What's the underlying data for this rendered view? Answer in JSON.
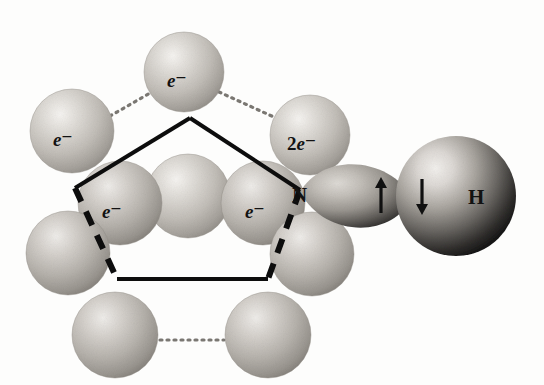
{
  "figure": {
    "background_color": "#fdfdfc",
    "width": 544,
    "height": 385
  },
  "palette": {
    "sphere_light": "#d8d5d0",
    "sphere_mid": "#b4b0aa",
    "sphere_shadow": "#8e8a84",
    "sphere_dark": "#6f6b66",
    "highlight": "#f4f2ef",
    "lobe_light": "#cfcbc5",
    "lobe_dark": "#2b2a28",
    "hydrogen_light": "#e8e5e1",
    "hydrogen_dark": "#141414",
    "outline_black": "#0d0d0d",
    "dotted_gray": "#7a7772"
  },
  "labels": {
    "electron_single": "e",
    "electron_superscript": "−",
    "electron_pair_count": "2",
    "nitrogen": "N",
    "hydrogen": "H",
    "spin_up": "↑",
    "spin_down": "↓"
  },
  "spheres": [
    {
      "id": "sphere-top",
      "name": "surface-atom-top",
      "cx": 184,
      "cy": 72,
      "r": 40,
      "shade": "light",
      "label": "e-",
      "label_dx": -17,
      "label_dy": 7
    },
    {
      "id": "sphere-upper-left",
      "name": "surface-atom-upper-left",
      "cx": 72,
      "cy": 131,
      "r": 42,
      "shade": "light",
      "label": "e-",
      "label_dx": -19,
      "label_dy": 7
    },
    {
      "id": "sphere-upper-right",
      "name": "surface-atom-upper-right",
      "cx": 310,
      "cy": 135,
      "r": 40,
      "shade": "light",
      "label": "2e-",
      "label_dx": -23,
      "label_dy": 7
    },
    {
      "id": "sphere-inner-center",
      "name": "surface-atom-inner-center",
      "cx": 188,
      "cy": 196,
      "r": 42,
      "shade": "light",
      "label": null,
      "label_dx": 0,
      "label_dy": 0
    },
    {
      "id": "sphere-inner-left",
      "name": "surface-atom-inner-left",
      "cx": 120,
      "cy": 203,
      "r": 42,
      "shade": "mid",
      "label": "e-",
      "label_dx": -18,
      "label_dy": 7
    },
    {
      "id": "sphere-inner-right",
      "name": "surface-atom-inner-right",
      "cx": 263,
      "cy": 203,
      "r": 42,
      "shade": "mid",
      "label": "e-",
      "label_dx": -18,
      "label_dy": 7
    },
    {
      "id": "sphere-left-lower",
      "name": "surface-atom-left-lower",
      "cx": 68,
      "cy": 253,
      "r": 42,
      "shade": "mid",
      "label": null,
      "label_dx": 0,
      "label_dy": 0
    },
    {
      "id": "sphere-right-lower",
      "name": "surface-atom-right-lower",
      "cx": 312,
      "cy": 254,
      "r": 42,
      "shade": "mid",
      "label": null,
      "label_dx": 0,
      "label_dy": 0
    },
    {
      "id": "sphere-bottom-left",
      "name": "surface-atom-bottom-left",
      "cx": 115,
      "cy": 335,
      "r": 43,
      "shade": "mid",
      "label": null,
      "label_dx": 0,
      "label_dy": 0
    },
    {
      "id": "sphere-bottom-right",
      "name": "surface-atom-bottom-right",
      "cx": 268,
      "cy": 335,
      "r": 43,
      "shade": "mid",
      "label": null,
      "label_dx": 0,
      "label_dy": 0
    }
  ],
  "connectors": [
    {
      "name": "dotted-link-upper-left",
      "x1": 110,
      "y1": 116,
      "x2": 150,
      "y2": 93,
      "style": "dotted"
    },
    {
      "name": "dotted-link-upper-right",
      "x1": 219,
      "y1": 92,
      "x2": 276,
      "y2": 118,
      "style": "dotted"
    },
    {
      "name": "dotted-link-inner-center",
      "x1": 160,
      "y1": 205,
      "x2": 228,
      "y2": 205,
      "style": "dotted-faint"
    },
    {
      "name": "dotted-link-bottom",
      "x1": 160,
      "y1": 340,
      "x2": 224,
      "y2": 340,
      "style": "dotted"
    }
  ],
  "pentagon": {
    "name": "adsorption-site-pentagon",
    "apex": {
      "x": 190,
      "y": 118
    },
    "left_upper": {
      "x": 75,
      "y": 188
    },
    "right_upper": {
      "x": 300,
      "y": 190
    },
    "left_lower": {
      "x": 117,
      "y": 279
    },
    "right_lower": {
      "x": 268,
      "y": 279
    },
    "edges": [
      {
        "name": "edge-apex-to-left",
        "style": "solid"
      },
      {
        "name": "edge-apex-to-right",
        "style": "solid"
      },
      {
        "name": "edge-left-side",
        "style": "dashed"
      },
      {
        "name": "edge-right-side",
        "style": "dashed"
      },
      {
        "name": "edge-bottom",
        "style": "solid"
      }
    ]
  },
  "orbital_lobe": {
    "name": "nitrogen-lone-pair-lobe",
    "tip": {
      "x": 300,
      "y": 192
    },
    "center": {
      "x": 372,
      "y": 198
    },
    "width": 78,
    "height": 62
  },
  "hydrogen_sphere": {
    "name": "hydrogen-atom",
    "cx": 456,
    "cy": 196,
    "r": 60
  },
  "annotations": {
    "nitrogen_label": {
      "name": "nitrogen-label",
      "x": 298,
      "y": 196,
      "text": "N"
    },
    "hydrogen_label": {
      "name": "hydrogen-label",
      "x": 468,
      "y": 198,
      "text": "H"
    },
    "spin_up": {
      "name": "spin-up-arrow",
      "x": 381,
      "y": 196
    },
    "spin_down": {
      "name": "spin-down-arrow",
      "x": 422,
      "y": 196
    }
  }
}
